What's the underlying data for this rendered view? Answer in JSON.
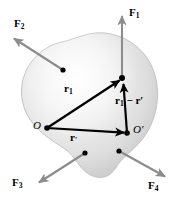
{
  "figure": {
    "body_shape": {
      "name": "irregular-blob",
      "fill_light": "#f2f2f2",
      "fill_mid": "#e2e2e2",
      "fill_dark": "#cfcfcf",
      "outline": "#b8b8b8"
    },
    "colors": {
      "force_arrow": "#8c8c8c",
      "vector_arrow": "#000000",
      "dot": "#000000",
      "text": "#000000",
      "background": "#ffffff"
    }
  },
  "forces": [
    {
      "id": "F1",
      "label_main": "F",
      "label_sub": "1",
      "direction": "up",
      "origin": {
        "x": 122,
        "y": 78
      },
      "tip": {
        "x": 122,
        "y": 14
      },
      "label_pos": {
        "x": 129,
        "y": 13
      }
    },
    {
      "id": "F2",
      "label_main": "F",
      "label_sub": "2",
      "direction": "up-left",
      "origin": {
        "x": 63,
        "y": 70
      },
      "tip": {
        "x": 12,
        "y": 37
      },
      "label_pos": {
        "x": 14,
        "y": 24
      }
    },
    {
      "id": "F3",
      "label_main": "F",
      "label_sub": "3",
      "direction": "down-left",
      "origin": {
        "x": 85,
        "y": 153
      },
      "tip": {
        "x": 37,
        "y": 184
      },
      "label_pos": {
        "x": 14,
        "y": 181
      }
    },
    {
      "id": "F4",
      "label_main": "F",
      "label_sub": "4",
      "direction": "down-right",
      "origin": {
        "x": 119,
        "y": 151
      },
      "tip": {
        "x": 167,
        "y": 178
      },
      "label_pos": {
        "x": 148,
        "y": 184
      }
    }
  ],
  "points": [
    {
      "id": "O",
      "label": "O",
      "x": 47,
      "y": 128,
      "label_pos": {
        "x": 33,
        "y": 121
      }
    },
    {
      "id": "Oprime",
      "label": "O′",
      "x": 127,
      "y": 133,
      "label_pos": {
        "x": 133,
        "y": 126
      }
    },
    {
      "id": "P",
      "label": "",
      "x": 122,
      "y": 78,
      "label_pos": {
        "x": 0,
        "y": 0
      }
    }
  ],
  "vectors": [
    {
      "id": "r1",
      "label_main": "r",
      "label_sub": "1",
      "label_suffix": "",
      "from": "O",
      "to": "P",
      "label_pos": {
        "x": 67,
        "y": 89
      }
    },
    {
      "id": "rprime",
      "label_main": "r",
      "label_sub": "",
      "label_suffix": "′",
      "from": "O",
      "to": "Oprime",
      "label_pos": {
        "x": 72,
        "y": 136
      }
    },
    {
      "id": "r1-minus-rprime",
      "label_main": "r",
      "label_sub": "1",
      "label_suffix": " − r′",
      "from": "Oprime",
      "to": "P",
      "label_pos": {
        "x": 117,
        "y": 100
      }
    }
  ]
}
